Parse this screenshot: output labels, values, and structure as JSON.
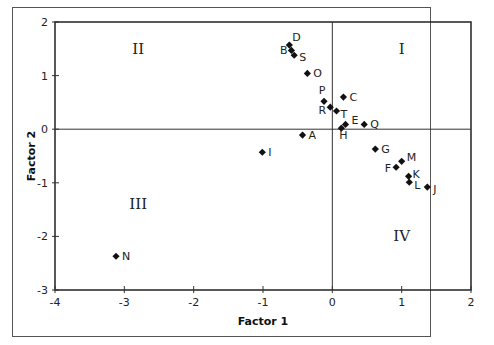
{
  "chart_data": {
    "type": "scatter",
    "title": "",
    "xlabel": "Factor 1",
    "ylabel": "Factor 2",
    "xlim": [
      -4,
      2
    ],
    "ylim": [
      -3,
      2
    ],
    "x_ticks": [
      "-4",
      "-3",
      "-2",
      "-1",
      "0",
      "1",
      "2"
    ],
    "y_ticks": [
      "2",
      "1",
      "0",
      "-1",
      "-2",
      "-3"
    ],
    "grid": false,
    "reference_lines": {
      "x": 0,
      "y": 0
    },
    "quadrant_labels": [
      {
        "label": "I",
        "x": 1.0,
        "y": 1.5
      },
      {
        "label": "II",
        "x": -2.8,
        "y": 1.5
      },
      {
        "label": "III",
        "x": -2.8,
        "y": -1.4
      },
      {
        "label": "IV",
        "x": 1.0,
        "y": -2.0
      }
    ],
    "points": [
      {
        "label": "A",
        "x": -0.43,
        "y": -0.11
      },
      {
        "label": "B",
        "x": -0.59,
        "y": 1.47
      },
      {
        "label": "C",
        "x": 0.16,
        "y": 0.6
      },
      {
        "label": "D",
        "x": -0.62,
        "y": 1.57
      },
      {
        "label": "E",
        "x": 0.19,
        "y": 0.09
      },
      {
        "label": "F",
        "x": 0.92,
        "y": -0.71
      },
      {
        "label": "G",
        "x": 0.62,
        "y": -0.37
      },
      {
        "label": "H",
        "x": 0.13,
        "y": 0.02
      },
      {
        "label": "I",
        "x": -1.01,
        "y": -0.43
      },
      {
        "label": "J",
        "x": 1.37,
        "y": -1.08
      },
      {
        "label": "K",
        "x": 1.1,
        "y": -0.88
      },
      {
        "label": "L",
        "x": 1.11,
        "y": -0.99
      },
      {
        "label": "M",
        "x": 1.0,
        "y": -0.6
      },
      {
        "label": "N",
        "x": -3.12,
        "y": -2.37
      },
      {
        "label": "O",
        "x": -0.36,
        "y": 1.04
      },
      {
        "label": "P",
        "x": -0.12,
        "y": 0.52
      },
      {
        "label": "Q",
        "x": 0.46,
        "y": 0.09
      },
      {
        "label": "R",
        "x": -0.03,
        "y": 0.41
      },
      {
        "label": "S",
        "x": -0.55,
        "y": 1.38
      },
      {
        "label": "T",
        "x": 0.06,
        "y": 0.34
      }
    ],
    "marker": "diamond",
    "marker_color": "#111111"
  }
}
